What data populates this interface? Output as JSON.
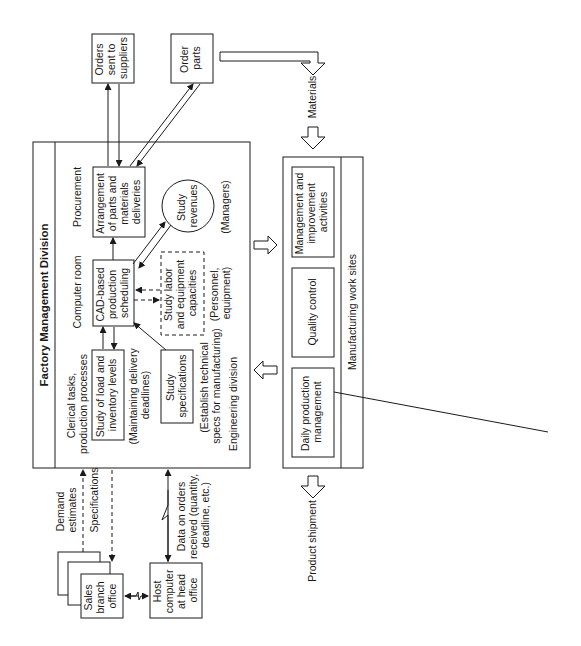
{
  "factory": {
    "title": "Factory Management Division",
    "sections": {
      "procurement": "Procurement",
      "computer_room": "Computer room",
      "clerical": [
        "Clerical tasks,",
        "production processes"
      ],
      "engineering": "Engineering division"
    },
    "boxes": {
      "arrangement": [
        "Arrangement",
        "of parts and",
        "materials",
        "deliveries"
      ],
      "cad": [
        "CAD-based",
        "production",
        "scheduling"
      ],
      "load": [
        "Study of load and",
        "inventory levels"
      ],
      "specs": [
        "Study",
        "specifications"
      ],
      "revenues": [
        "Study",
        "revenues"
      ],
      "labor": [
        "Study labor",
        "and equipment",
        "capacities"
      ]
    },
    "notes": {
      "managers": "(Managers)",
      "personnel": [
        "(Personnel,",
        "equipment)"
      ],
      "maintaining": [
        "(Maintaining delivery",
        "deadlines)"
      ],
      "establish": [
        "(Establish technical",
        "specs for manufacturing)"
      ]
    }
  },
  "external": {
    "orders_sent": [
      "Orders",
      "sent to",
      "suppliers"
    ],
    "order_parts": [
      "Order",
      "parts"
    ],
    "materials": "Materials",
    "sales_office": [
      "Sales",
      "branch",
      "office"
    ],
    "host_computer": [
      "Host",
      "computer",
      "at head",
      "office"
    ],
    "demand": [
      "Demand",
      "estimates"
    ],
    "specifications": "Specifications",
    "data_orders": [
      "Data on orders",
      "received (quantity,",
      "deadline, etc.)"
    ],
    "product_shipment": "Product shipment"
  },
  "manufacturing": {
    "title": "Manufacturing work sites",
    "boxes": {
      "mgmt": [
        "Management and",
        "improvement",
        "activities"
      ],
      "quality": "Quality control",
      "daily": [
        "Daily production",
        "management"
      ]
    }
  }
}
